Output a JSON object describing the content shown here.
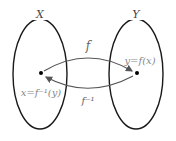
{
  "diagram": {
    "sets": [
      {
        "name": "X",
        "cx": 40,
        "cy": 74,
        "rx": 27,
        "ry": 55
      },
      {
        "name": "Y",
        "cx": 136,
        "cy": 74,
        "rx": 27,
        "ry": 55
      }
    ],
    "points": [
      {
        "label": "x=f⁻¹(y)",
        "x": 41,
        "y": 73
      },
      {
        "label": "y=f(x)",
        "x": 137,
        "y": 73
      }
    ],
    "arrows": [
      {
        "label": "f",
        "from": "X",
        "to": "Y"
      },
      {
        "label": "f⁻¹",
        "from": "Y",
        "to": "X"
      }
    ],
    "colors": {
      "outline": "#1a1a1a",
      "arrow": "#555555",
      "label": "#888888",
      "point": "#000000"
    }
  }
}
